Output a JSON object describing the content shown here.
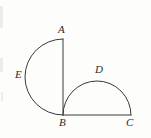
{
  "figure": {
    "background_color": "#fdfdfc",
    "stroke_color": "#3a3a3a",
    "label_color": "#2b2b2b",
    "stroke_width": 1,
    "width": 151,
    "height": 138,
    "points": {
      "A": {
        "label": "A",
        "x": 63,
        "y": 39
      },
      "B": {
        "label": "B",
        "x": 63,
        "y": 115
      },
      "C": {
        "label": "C",
        "x": 131,
        "y": 115
      },
      "D": {
        "label": "D",
        "x": 97,
        "y": 80
      },
      "E": {
        "label": "E",
        "x": 25,
        "y": 77
      }
    },
    "labels": [
      {
        "name": "A",
        "text": "A",
        "x": 58,
        "y": 24
      },
      {
        "name": "B",
        "text": "B",
        "x": 59,
        "y": 117
      },
      {
        "name": "C",
        "text": "C",
        "x": 126,
        "y": 117
      },
      {
        "name": "D",
        "text": "D",
        "x": 95,
        "y": 64
      },
      {
        "name": "E",
        "text": "E",
        "x": 15,
        "y": 69
      }
    ],
    "segments": [
      {
        "name": "segment-AB",
        "from": "A",
        "to": "B",
        "x1": 63,
        "y1": 39,
        "x2": 63,
        "y2": 115
      },
      {
        "name": "segment-BC",
        "from": "B",
        "to": "C",
        "x1": 63,
        "y1": 115,
        "x2": 131,
        "y2": 115
      }
    ],
    "arcs": [
      {
        "name": "large-semicircle-AEB",
        "through": "E",
        "diameter": "AB",
        "bulge": "left",
        "radius": 38,
        "path": "M 63 39 A 38 38 0 0 0 63 115"
      },
      {
        "name": "small-semicircle-BDC",
        "through": "D",
        "diameter": "BC",
        "bulge": "up",
        "radius": 34,
        "path": "M 63 115 A 34 34 0 0 1 131 115"
      }
    ],
    "scan_marks": [
      {
        "name": "scan-mark-top",
        "x": 0,
        "y": 6,
        "width": 3,
        "height": 22
      },
      {
        "name": "scan-mark-middle",
        "x": 0,
        "y": 58,
        "width": 3,
        "height": 14
      },
      {
        "name": "scan-mark-lower",
        "x": 1,
        "y": 92,
        "width": 2,
        "height": 9
      }
    ]
  }
}
